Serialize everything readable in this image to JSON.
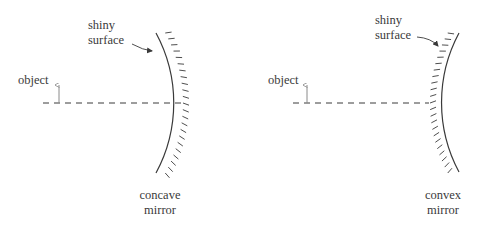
{
  "diagram": {
    "type": "ray-optics mirror comparison",
    "colors": {
      "ink": "#3a3a3a",
      "object_arrow": "#8a8a8a",
      "background": "#ffffff"
    },
    "panels": [
      {
        "id": "concave",
        "object_label": "object",
        "surface_label_line1": "shiny",
        "surface_label_line2": "surface",
        "mirror_label_line1": "concave",
        "mirror_label_line2": "mirror"
      },
      {
        "id": "convex",
        "object_label": "object",
        "surface_label_line1": "shiny",
        "surface_label_line2": "surface",
        "mirror_label_line1": "convex",
        "mirror_label_line2": "mirror"
      }
    ]
  }
}
